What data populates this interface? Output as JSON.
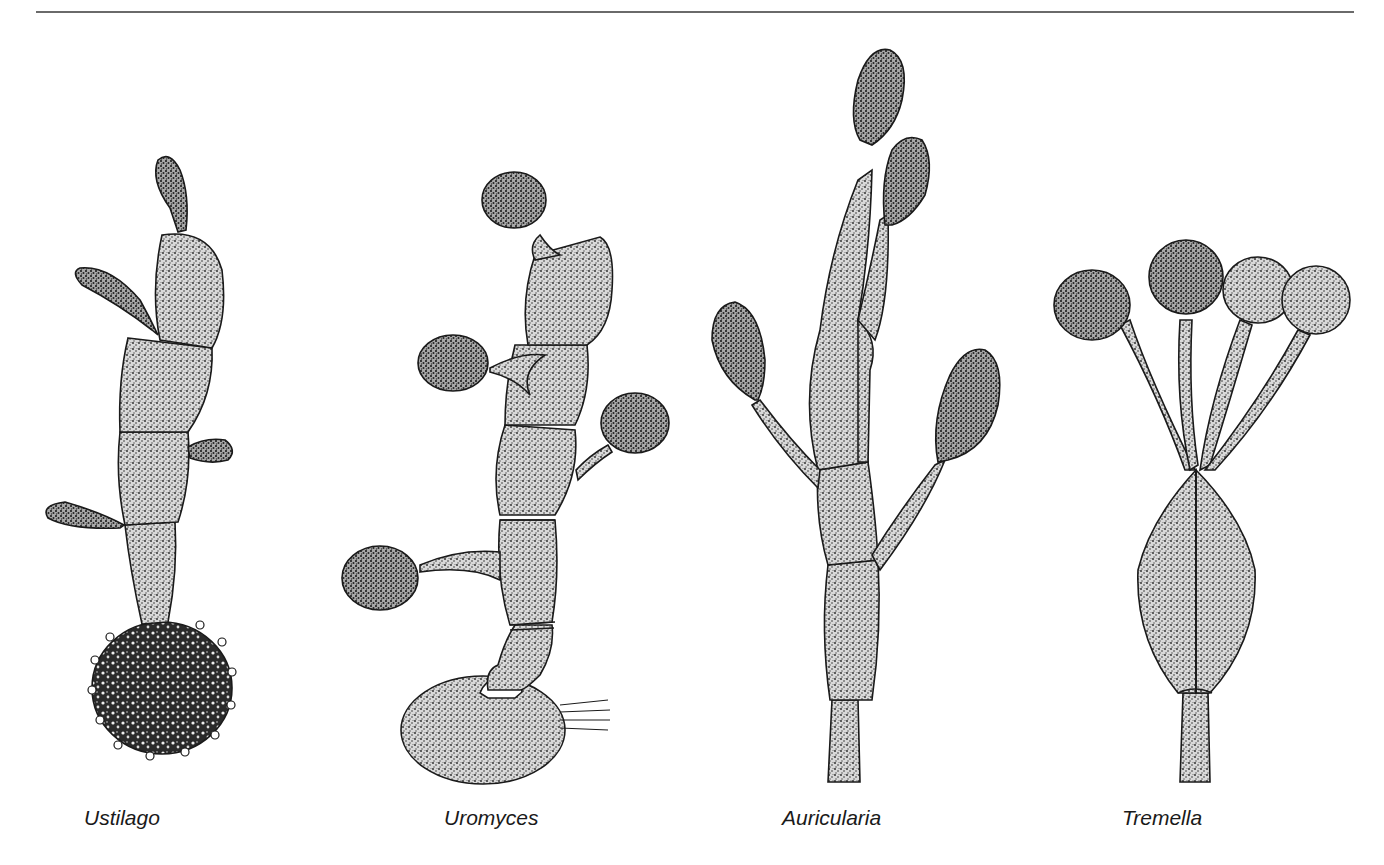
{
  "figure": {
    "panels": [
      {
        "label": "Ustilago",
        "x": 84
      },
      {
        "label": "Uromyces",
        "x": 444
      },
      {
        "label": "Auricularia",
        "x": 782
      },
      {
        "label": "Tremella",
        "x": 1122
      }
    ],
    "colors": {
      "ink": "#1a1a1a",
      "rule": "#6a6a6a",
      "paper": "#ffffff"
    }
  }
}
